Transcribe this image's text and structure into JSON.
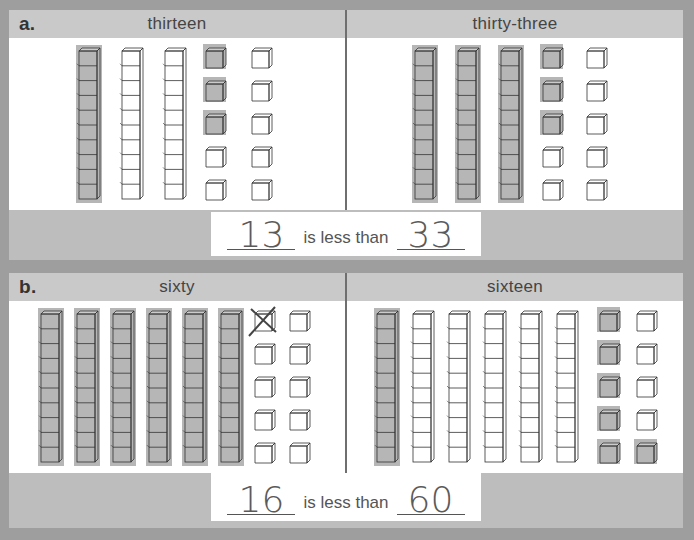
{
  "problems": [
    {
      "letter": "a.",
      "left_panel": {
        "label": "thirteen",
        "tens": 3,
        "ones": 10,
        "shaded_tens": 1,
        "shaded_ones": 3
      },
      "right_panel": {
        "label": "thirty-three",
        "tens": 3,
        "ones": 10,
        "shaded_tens": 3,
        "shaded_ones": 3
      },
      "answer": {
        "first_blank": "13",
        "connector": "is less than",
        "second_blank": "33"
      }
    },
    {
      "letter": "b.",
      "left_panel": {
        "label": "sixty",
        "tens": 6,
        "ones": 10,
        "shaded_tens": 6,
        "shaded_ones": 0,
        "crossed_ones": 1
      },
      "right_panel": {
        "label": "sixteen",
        "tens": 6,
        "ones": 10,
        "shaded_tens": 1,
        "shaded_ones": 6
      },
      "answer": {
        "first_blank": "16",
        "connector": "is less than",
        "second_blank": "60"
      }
    }
  ],
  "colors": {
    "background": "#9e9e9e",
    "header": "#c9c9c9",
    "panel": "#ffffff",
    "pencil": "#7a7a7a"
  }
}
